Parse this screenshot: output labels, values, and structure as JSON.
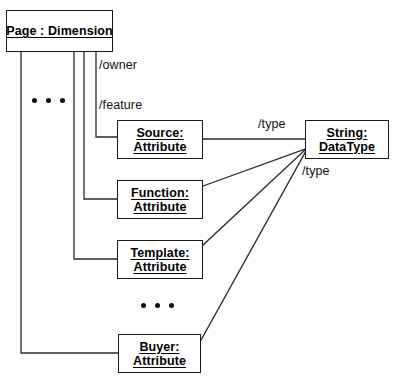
{
  "diagram": {
    "type": "uml-object-diagram",
    "background_color": "#fdfdfd",
    "stroke_color": "#1a1a1a",
    "nodes": [
      {
        "id": "page",
        "name_line": "Page : Dimension",
        "kind_line": ""
      },
      {
        "id": "source",
        "name_line": "Source:",
        "kind_line": "Attribute"
      },
      {
        "id": "function",
        "name_line": "Function:",
        "kind_line": "Attribute"
      },
      {
        "id": "template",
        "name_line": "Template:",
        "kind_line": "Attribute"
      },
      {
        "id": "buyer",
        "name_line": "Buyer:",
        "kind_line": "Attribute"
      },
      {
        "id": "string",
        "name_line": "String:",
        "kind_line": "DataType"
      }
    ],
    "edge_labels": {
      "owner": "/owner",
      "feature": "/feature",
      "type_top": "/type",
      "type_bottom": "/type"
    },
    "ellipses": {
      "left_group": "•  •  •",
      "middle_group": "•  •  •"
    }
  }
}
